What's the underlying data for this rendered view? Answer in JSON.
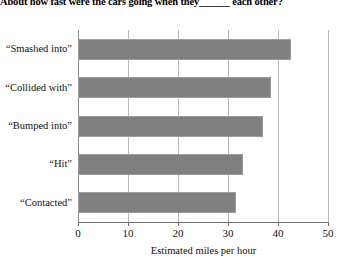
{
  "figure": {
    "title": "About how fast were the cars going when they______ each other?"
  },
  "chart_data": {
    "type": "bar",
    "orientation": "horizontal",
    "title": "About how fast were the cars going when they______ each other?",
    "categories": [
      "“Smashed into”",
      "“Collided with”",
      "“Bumped into”",
      "“Hit”",
      "“Contacted”"
    ],
    "values": [
      42.5,
      38.5,
      37,
      33,
      31.5
    ],
    "xlabel": "Estimated miles per hour",
    "ylabel": "",
    "xlim": [
      0,
      50
    ],
    "xticks": [
      0,
      10,
      20,
      30,
      40,
      50
    ],
    "xtick_labels": [
      "0",
      "10",
      "20",
      "30",
      "40",
      "50"
    ],
    "grid": "vertical",
    "legend": null,
    "bar_color": "#808080",
    "bar_border_color": "#9c9c9c",
    "gridline_color": "#b9b9b9",
    "axis_color": "#6f6f6f"
  }
}
